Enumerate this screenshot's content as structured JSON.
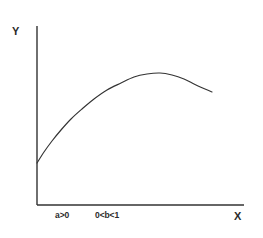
{
  "chart_data": {
    "type": "line",
    "title": "",
    "subtitle": "",
    "xlabel": "X",
    "ylabel": "Y",
    "grid": false,
    "legend": null,
    "axis_color": "#333333",
    "curve_color": "#333333",
    "background_color": "#ffffff",
    "xlim": [
      0,
      100
    ],
    "ylim": [
      0,
      100
    ],
    "annotations": [
      {
        "text": "a>0",
        "x": 12,
        "y": -6
      },
      {
        "text": "0<b<1",
        "x": 32,
        "y": -6
      }
    ],
    "series": [
      {
        "name": "curve",
        "comment": "Concave production-type curve y = a*x^b rising from a positive intercept, peaking then declining",
        "x": [
          0,
          4,
          8,
          13,
          18,
          24,
          30,
          37,
          44,
          52,
          60,
          68,
          76,
          84,
          92,
          100
        ],
        "y": [
          23,
          31,
          39,
          47,
          54,
          61,
          67,
          72,
          76,
          79,
          80,
          79.5,
          78,
          76,
          73,
          70
        ]
      }
    ],
    "path_points_px": [
      [
        37,
        163
      ],
      [
        44,
        152
      ],
      [
        52,
        141
      ],
      [
        61,
        130
      ],
      [
        71,
        119
      ],
      [
        82,
        109
      ],
      [
        94,
        99
      ],
      [
        107,
        90
      ],
      [
        121,
        83
      ],
      [
        134,
        77
      ],
      [
        147,
        74
      ],
      [
        160,
        73
      ],
      [
        172,
        75
      ],
      [
        184,
        79
      ],
      [
        196,
        85
      ],
      [
        212,
        92
      ]
    ],
    "axes_px": {
      "x_axis": {
        "x1": 37,
        "y1": 205,
        "x2": 244,
        "y2": 205
      },
      "y_axis": {
        "x1": 37,
        "y1": 26,
        "x2": 37,
        "y2": 205
      }
    }
  },
  "labels": {
    "y_axis": "Y",
    "x_axis": "X",
    "param_a": "a>0",
    "param_b": "0<b<1"
  }
}
